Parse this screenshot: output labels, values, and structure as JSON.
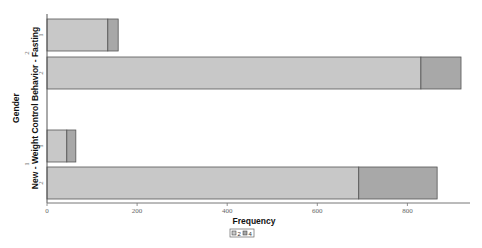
{
  "chart_data": {
    "type": "bar",
    "orientation": "horizontal",
    "stacked": true,
    "title": "",
    "xlabel": "Frequency",
    "ylabel_outer": "New - Weight Control Behavior - Fasting",
    "ylabel_inner": "Gender",
    "xlim": [
      0,
      930
    ],
    "xticks": [
      0,
      200,
      400,
      600,
      800
    ],
    "xtick_labels": [
      "0",
      "200",
      "400",
      "600",
      "800"
    ],
    "grid": false,
    "groups": [
      {
        "label": "2",
        "bars": [
          {
            "label": "1",
            "segments": [
              135,
              23
            ]
          },
          {
            "label": "2",
            "segments": [
              830,
              89
            ]
          }
        ]
      },
      {
        "label": "1",
        "bars": [
          {
            "label": "1",
            "segments": [
              44,
              20
            ]
          },
          {
            "label": "2",
            "segments": [
              692,
              174
            ]
          }
        ]
      }
    ],
    "series": [
      {
        "name": "2",
        "color": "#c8c8c8"
      },
      {
        "name": "4",
        "color": "#a8a8a8"
      }
    ],
    "legend": {
      "placement": "bottom-center",
      "entries": [
        "2",
        "4"
      ]
    }
  }
}
